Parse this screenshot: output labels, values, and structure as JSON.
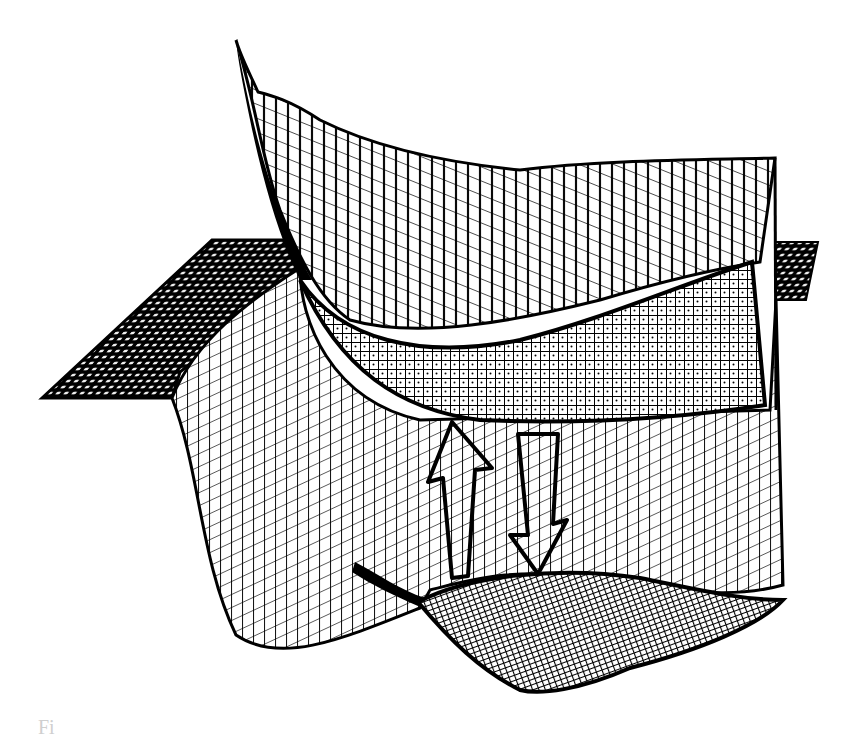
{
  "figure": {
    "upper_surface": {
      "label": "",
      "mesh": "wireframe-grid"
    },
    "lower_surface": {
      "label": "",
      "mesh": "wireframe-grid"
    },
    "arrows": [
      {
        "direction": "up",
        "style": "hollow-outline"
      },
      {
        "direction": "down",
        "style": "hollow-outline"
      }
    ],
    "colors": {
      "ink": "#000000",
      "paper": "#ffffff",
      "caption_fragment": "#cfcfcf"
    }
  },
  "caption": {
    "text": "Fi"
  }
}
